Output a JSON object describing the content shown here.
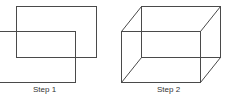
{
  "colors": {
    "stroke": "#4a4a4a",
    "text": "#333333",
    "background": "#ffffff"
  },
  "figures": [
    {
      "id": "step1",
      "label": "Step 1",
      "description": "Two overlapping offset rectangles",
      "back_rect": {
        "x": 16,
        "y": 6,
        "w": 80,
        "h": 51
      },
      "front_rect": {
        "x": -1,
        "y": 31,
        "w": 77,
        "h": 51
      }
    },
    {
      "id": "step2",
      "label": "Step 2",
      "description": "Wireframe box formed by joining rectangle corners",
      "back_rect": {
        "x": 141,
        "y": 6,
        "w": 79,
        "h": 51
      },
      "front_rect": {
        "x": 121,
        "y": 31,
        "w": 79,
        "h": 51
      }
    }
  ]
}
